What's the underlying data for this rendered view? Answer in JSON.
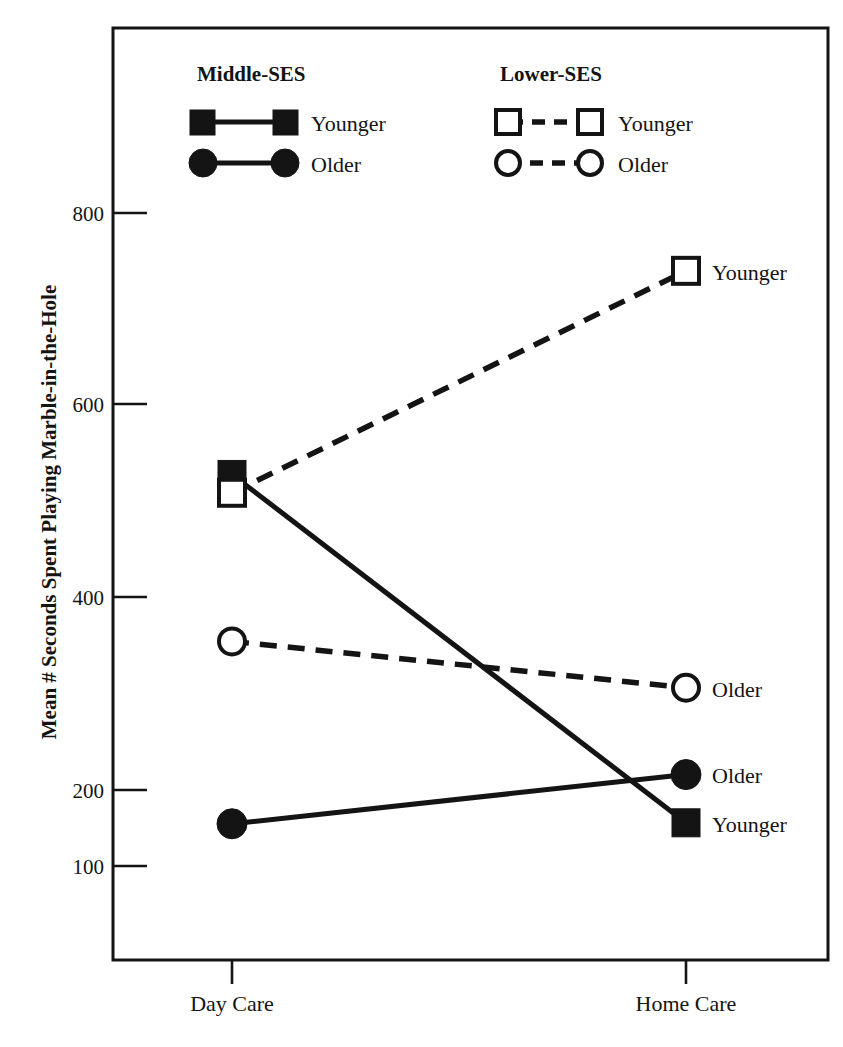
{
  "chart_data": {
    "type": "line",
    "title": "",
    "xlabel": "",
    "ylabel": "Mean # Seconds Spent Playing Marble-in-the-Hole",
    "categories": [
      "Day Care",
      "Home Care"
    ],
    "x_tick_labels": [
      "Day Care",
      "Home Care"
    ],
    "y_tick_labels": [
      "800",
      "600",
      "400",
      "200",
      "100"
    ],
    "y_tick_values": [
      800,
      600,
      400,
      200,
      100
    ],
    "ylim": [
      60,
      900
    ],
    "grid": false,
    "legend_position": "top-inside",
    "series": [
      {
        "name": "Middle-SES Younger",
        "group": "Middle-SES",
        "age": "Younger",
        "marker": "filled-square",
        "line_style": "solid",
        "values": [
          527,
          166
        ],
        "end_label": "Younger"
      },
      {
        "name": "Middle-SES Older",
        "group": "Middle-SES",
        "age": "Older",
        "marker": "filled-circle",
        "line_style": "solid",
        "values": [
          165,
          216
        ],
        "end_label": "Older"
      },
      {
        "name": "Lower-SES Younger",
        "group": "Lower-SES",
        "age": "Younger",
        "marker": "open-square",
        "line_style": "dashed",
        "values": [
          508,
          738
        ],
        "end_label": "Younger"
      },
      {
        "name": "Lower-SES Older",
        "group": "Lower-SES",
        "age": "Older",
        "marker": "open-circle",
        "line_style": "dashed",
        "values": [
          354,
          306
        ],
        "end_label": "Older"
      }
    ]
  },
  "legend": {
    "groups": [
      {
        "heading": "Middle-SES",
        "entries": [
          {
            "label": "Younger",
            "marker": "filled-square",
            "line_style": "solid"
          },
          {
            "label": "Older",
            "marker": "filled-circle",
            "line_style": "solid"
          }
        ]
      },
      {
        "heading": "Lower-SES",
        "entries": [
          {
            "label": "Younger",
            "marker": "open-square",
            "line_style": "dashed"
          },
          {
            "label": "Older",
            "marker": "open-circle",
            "line_style": "dashed"
          }
        ]
      }
    ]
  },
  "axes": {
    "y_title": "Mean # Seconds Spent Playing Marble-in-the-Hole",
    "y_ticks": [
      {
        "label": "800",
        "value": 800
      },
      {
        "label": "600",
        "value": 600
      },
      {
        "label": "400",
        "value": 400
      },
      {
        "label": "200",
        "value": 200
      },
      {
        "label": "100",
        "value": 100
      }
    ],
    "x_ticks": [
      {
        "label": "Day Care"
      },
      {
        "label": "Home Care"
      }
    ]
  },
  "point_labels": {
    "lower_younger_home": "Younger",
    "lower_older_home": "Older",
    "middle_older_home": "Older",
    "middle_younger_home": "Younger"
  },
  "colors": {
    "ink": "#141414",
    "background": "#ffffff"
  }
}
